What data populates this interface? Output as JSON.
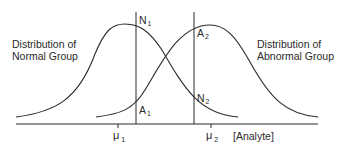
{
  "diagram": {
    "labels": {
      "normal_group_line1": "Distribution of",
      "normal_group_line2": "Normal Group",
      "abnormal_group_line1": "Distribution of",
      "abnormal_group_line2": "Abnormal Group"
    },
    "points": {
      "n1": {
        "letter": "N",
        "sub": "1"
      },
      "a1": {
        "letter": "A",
        "sub": "1"
      },
      "a2": {
        "letter": "A",
        "sub": "2"
      },
      "n2": {
        "letter": "N",
        "sub": "2"
      }
    },
    "axis": {
      "mu1": {
        "symbol": "μ",
        "sub": "1"
      },
      "mu2": {
        "symbol": "μ",
        "sub": "2"
      },
      "x_label": "[Analyte]"
    },
    "colors": {
      "line": "#2a2a2a",
      "background": "#ffffff"
    }
  }
}
